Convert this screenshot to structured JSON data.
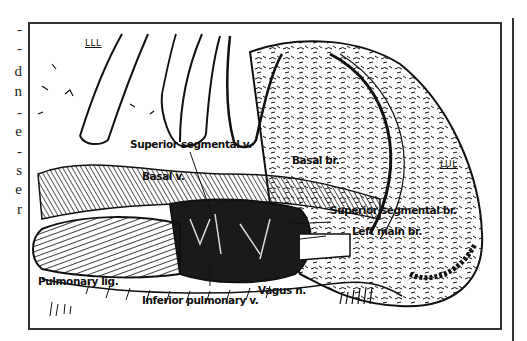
{
  "figure": {
    "type": "anatomical line illustration",
    "lobe_labels": {
      "lll": "LLL",
      "lul": "LUL"
    },
    "structure_labels": [
      {
        "id": "superior_segmental_v",
        "text": "Superior segmental v."
      },
      {
        "id": "basal_br",
        "text": "Basal br."
      },
      {
        "id": "basal_v",
        "text": "Basal v."
      },
      {
        "id": "superior_segmental_br",
        "text": "Superior segmental br."
      },
      {
        "id": "left_main_br",
        "text": "Left main br."
      },
      {
        "id": "pulmonary_lig",
        "text": "Pulmonary lig."
      },
      {
        "id": "inferior_pulmonary_v",
        "text": "Inferior pulmonary v."
      },
      {
        "id": "vagus_n",
        "text": "Vagus n."
      }
    ]
  },
  "left_margin_fragments": [
    "-",
    "-",
    "d",
    "n",
    "-",
    "e",
    "-",
    "s",
    "e",
    "r"
  ],
  "colors": {
    "ink": "#111111",
    "frame": "#333333",
    "paper": "#ffffff"
  }
}
